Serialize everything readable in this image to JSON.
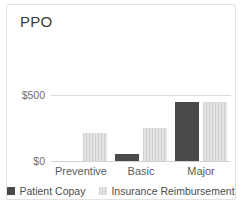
{
  "card": {
    "title": "PPO",
    "background": "#ffffff",
    "border_color": "#e2e2e2"
  },
  "chart_data": {
    "type": "bar",
    "title": "PPO",
    "xlabel": "",
    "ylabel": "",
    "categories": [
      "Preventive",
      "Basic",
      "Major"
    ],
    "series": [
      {
        "name": "Patient Copay",
        "color": "#4a4a4a",
        "values": [
          0,
          50,
          450
        ]
      },
      {
        "name": "Insurance Reimbursement",
        "color": "#d9d9d9",
        "values": [
          210,
          250,
          450
        ]
      }
    ],
    "ylim": [
      0,
      500
    ],
    "yticks": [
      0,
      500
    ],
    "ytick_labels": [
      "$0",
      "$500"
    ],
    "grid": true,
    "legend_position": "bottom",
    "grouping": "grouped"
  },
  "legend": {
    "items": [
      {
        "label": "Patient Copay",
        "color": "#4a4a4a"
      },
      {
        "label": "Insurance Reimbursement",
        "color": "#d9d9d9"
      }
    ]
  }
}
